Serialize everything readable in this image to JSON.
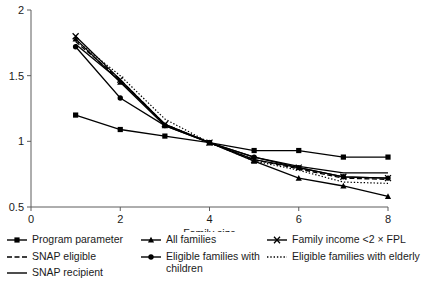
{
  "chart_data": {
    "type": "line",
    "title": "",
    "xlabel": "Family size",
    "ylabel": "",
    "xlim": [
      0,
      8
    ],
    "ylim": [
      0.5,
      2
    ],
    "xticks": [
      0,
      2,
      4,
      6,
      8
    ],
    "xtick_labels": [
      "0",
      "2",
      "4",
      "6",
      "8"
    ],
    "yticks": [
      0.5,
      1,
      1.5,
      2
    ],
    "ytick_labels": [
      "0.5",
      "1",
      "1.5",
      "2"
    ],
    "grid": false,
    "legend_position": "below",
    "x": [
      1,
      2,
      3,
      4,
      5,
      6,
      7,
      8
    ],
    "series": [
      {
        "name": "Program parameter",
        "marker": "square",
        "dash": "solid",
        "values": [
          1.2,
          1.09,
          1.04,
          0.99,
          0.93,
          0.93,
          0.88,
          0.88
        ]
      },
      {
        "name": "SNAP eligible",
        "marker": "none",
        "dash": "dashed",
        "values": [
          1.76,
          1.47,
          1.13,
          0.99,
          0.86,
          0.79,
          0.72,
          0.71
        ]
      },
      {
        "name": "SNAP recipient",
        "marker": "none",
        "dash": "solid",
        "values": [
          1.74,
          1.46,
          1.13,
          0.99,
          0.88,
          0.81,
          0.76,
          0.76
        ]
      },
      {
        "name": "All families",
        "marker": "triangle",
        "dash": "solid",
        "values": [
          1.78,
          1.45,
          1.12,
          0.99,
          0.85,
          0.72,
          0.66,
          0.58
        ]
      },
      {
        "name": "Eligible families with children",
        "marker": "circle",
        "dash": "solid",
        "values": [
          1.72,
          1.33,
          1.12,
          0.99,
          0.88,
          0.8,
          0.73,
          0.72
        ]
      },
      {
        "name": "Family income <2 × FPL",
        "marker": "cross",
        "dash": "solid",
        "values": [
          1.8,
          1.47,
          1.13,
          0.99,
          0.86,
          0.8,
          0.73,
          0.72
        ]
      },
      {
        "name": "Eligible families with elderly",
        "marker": "none",
        "dash": "dotted",
        "values": [
          1.77,
          1.5,
          1.17,
          0.99,
          0.85,
          0.78,
          0.69,
          0.68
        ]
      }
    ]
  },
  "legend": {
    "columns": [
      [
        {
          "label": "Program parameter",
          "key": "solid-square-key"
        },
        {
          "label": "SNAP eligible",
          "key": "dashed-key"
        },
        {
          "label": "SNAP recipient",
          "key": "solid-key"
        }
      ],
      [
        {
          "label": "All families",
          "key": "solid-triangle-key"
        },
        {
          "label": "Eligible families with\nchildren",
          "key": "solid-circle-key"
        }
      ],
      [
        {
          "label": "Family income <2 × FPL",
          "key": "solid-cross-key"
        },
        {
          "label": "Eligible families with elderly",
          "key": "dotted-key"
        }
      ]
    ]
  },
  "colors": {
    "series": "#000000",
    "axis": "#5d5d5d",
    "text": "#1a1a1a",
    "background": "#ffffff"
  }
}
